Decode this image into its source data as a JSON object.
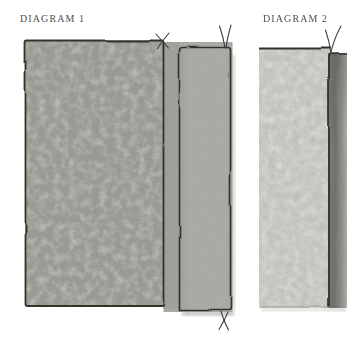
{
  "figure": {
    "background": "#ffffff",
    "label_color": "#524f49",
    "outline_color": "#31312c",
    "stitch_color": "#22221d",
    "thread_color": "#3f3f39"
  },
  "diagrams": [
    {
      "label": "DIAGRAM 1",
      "colors": {
        "panel": "#9a9a95",
        "flap": "#a0a09b",
        "strip": "#abaaa6"
      }
    },
    {
      "label": "DIAGRAM 2",
      "colors": {
        "panel": "#c7c7c3",
        "strip": "#8b8b86"
      }
    }
  ]
}
